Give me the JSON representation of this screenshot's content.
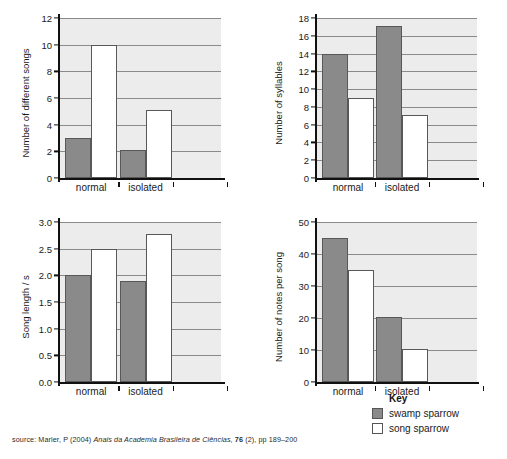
{
  "key": {
    "title": "Key",
    "entries": [
      {
        "label": "swamp sparrow",
        "color": "#8a8a8a"
      },
      {
        "label": "song sparrow",
        "color": "#ffffff"
      }
    ]
  },
  "source": {
    "prefix": "source: Marler, P (2004) ",
    "journal": "Anais da Academia Brasileira de Ciências,",
    "volume": "76",
    "suffix": " (2), pp 189–200"
  },
  "chart_data": [
    {
      "id": "different-songs",
      "type": "bar",
      "title": "",
      "xlabel": "",
      "ylabel": "Number of different songs",
      "categories": [
        "normal",
        "isolated"
      ],
      "ylim": [
        0,
        12
      ],
      "yticks": [
        0,
        2,
        4,
        6,
        8,
        10,
        12
      ],
      "ytick_labels": [
        "0",
        "2",
        "4",
        "6",
        "8",
        "10",
        "12"
      ],
      "grid": true,
      "legend_position": "external-bottom-right",
      "series": [
        {
          "name": "swamp sparrow",
          "color": "#8a8a8a",
          "values": [
            3,
            2.1
          ]
        },
        {
          "name": "song sparrow",
          "color": "#ffffff",
          "values": [
            10,
            5.1
          ]
        }
      ]
    },
    {
      "id": "syllables",
      "type": "bar",
      "title": "",
      "xlabel": "",
      "ylabel": "Number of syllables",
      "categories": [
        "normal",
        "isolated"
      ],
      "ylim": [
        0,
        18
      ],
      "yticks": [
        0,
        2,
        4,
        6,
        8,
        10,
        12,
        14,
        16,
        18
      ],
      "ytick_labels": [
        "0",
        "2",
        "4",
        "6",
        "8",
        "10",
        "12",
        "14",
        "16",
        "18"
      ],
      "grid": true,
      "legend_position": "external-bottom-right",
      "series": [
        {
          "name": "swamp sparrow",
          "color": "#8a8a8a",
          "values": [
            14,
            17.1
          ]
        },
        {
          "name": "song sparrow",
          "color": "#ffffff",
          "values": [
            9,
            7.1
          ]
        }
      ]
    },
    {
      "id": "song-length",
      "type": "bar",
      "title": "",
      "xlabel": "",
      "ylabel": "Song length / s",
      "categories": [
        "normal",
        "isolated"
      ],
      "ylim": [
        0,
        3.0
      ],
      "yticks": [
        0,
        0.5,
        1.0,
        1.5,
        2.0,
        2.5,
        3.0
      ],
      "ytick_labels": [
        "0.0",
        "0.5",
        "1.0",
        "1.5",
        "2.0",
        "2.5",
        "3.0"
      ],
      "grid": true,
      "legend_position": "external-bottom-right",
      "series": [
        {
          "name": "swamp sparrow",
          "color": "#8a8a8a",
          "values": [
            2.0,
            1.9
          ]
        },
        {
          "name": "song sparrow",
          "color": "#ffffff",
          "values": [
            2.5,
            2.78
          ]
        }
      ]
    },
    {
      "id": "notes-per-song",
      "type": "bar",
      "title": "",
      "xlabel": "",
      "ylabel": "Number of notes per song",
      "categories": [
        "normal",
        "isolated"
      ],
      "ylim": [
        0,
        50
      ],
      "yticks": [
        0,
        10,
        20,
        30,
        40,
        50
      ],
      "ytick_labels": [
        "0",
        "10",
        "20",
        "30",
        "40",
        "50"
      ],
      "grid": true,
      "legend_position": "external-bottom-right",
      "series": [
        {
          "name": "swamp sparrow",
          "color": "#8a8a8a",
          "values": [
            45,
            20.3
          ]
        },
        {
          "name": "song sparrow",
          "color": "#ffffff",
          "values": [
            35,
            10.2
          ]
        }
      ]
    }
  ]
}
